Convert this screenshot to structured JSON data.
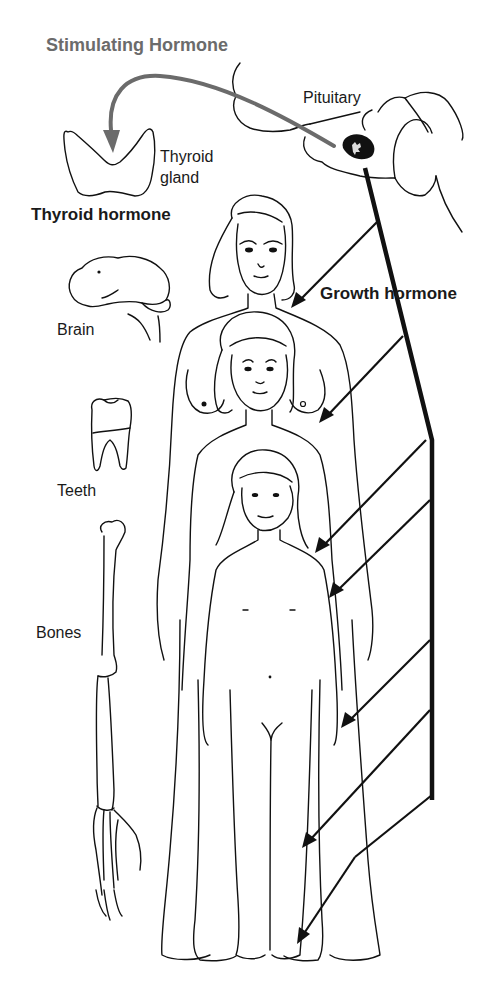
{
  "diagram": {
    "labels": {
      "stimulating_hormone": "Stimulating Hormone",
      "pituitary": "Pituitary",
      "thyroid_gland_line1": "Thyroid",
      "thyroid_gland_line2": "gland",
      "thyroid_hormone": "Thyroid hormone",
      "growth_hormone": "Growth hormone",
      "brain": "Brain",
      "teeth": "Teeth",
      "bones": "Bones"
    },
    "nodes": [
      {
        "id": "pituitary",
        "label": "Pituitary",
        "type": "gland"
      },
      {
        "id": "thyroid",
        "label": "Thyroid gland",
        "type": "gland"
      },
      {
        "id": "brain",
        "label": "Brain",
        "type": "target-organ"
      },
      {
        "id": "teeth",
        "label": "Teeth",
        "type": "target-organ"
      },
      {
        "id": "bones",
        "label": "Bones",
        "type": "target-organ"
      },
      {
        "id": "adult",
        "label": "Adult woman",
        "type": "body"
      },
      {
        "id": "adolescent",
        "label": "Adolescent girl",
        "type": "body"
      },
      {
        "id": "child",
        "label": "Child",
        "type": "body"
      }
    ],
    "edges": [
      {
        "from": "pituitary",
        "to": "thyroid",
        "label": "Stimulating Hormone",
        "style": "grey-curved-arrow"
      },
      {
        "from": "thyroid",
        "to": "brain/teeth/bones",
        "label": "Thyroid hormone",
        "style": "implied"
      },
      {
        "from": "pituitary",
        "to": "bodies",
        "label": "Growth hormone",
        "style": "black-trunk-with-7-arrows",
        "arrow_count": 7
      }
    ],
    "colors": {
      "line": "#111111",
      "stimulating_arrow": "#6b6b6b",
      "background": "#ffffff"
    }
  }
}
